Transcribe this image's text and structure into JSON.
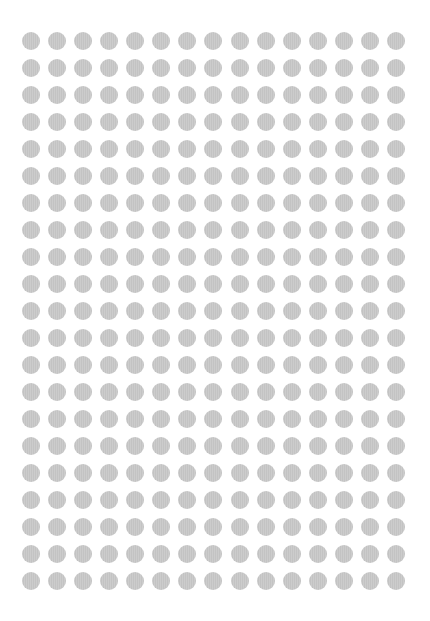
{
  "grid": {
    "columns": 15,
    "rows": 21,
    "dot_diameter": 18,
    "first_center_x": 31,
    "first_center_y": 41,
    "pitch_x": 26.07,
    "pitch_y": 27,
    "dot_color": "#c9c9c9",
    "background_color": "#ffffff"
  }
}
